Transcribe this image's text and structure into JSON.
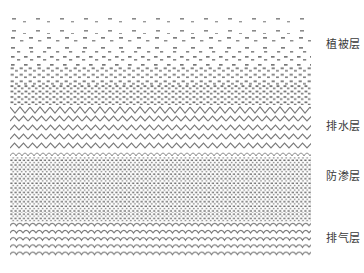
{
  "diagram": {
    "background_color": "#ffffff",
    "hatch_color": "#7a7a7a",
    "label_color": "#3b3b3b",
    "canvas": {
      "width": 364,
      "height": 273
    },
    "drawing_area": {
      "x": 10,
      "y": 14,
      "width": 301,
      "height": 249
    },
    "layers": [
      {
        "id": "vegetation",
        "label": "植被层",
        "pattern": "graduated-dash-stipple",
        "description": "sparse dashes at top becoming progressively denser downward",
        "top": 0,
        "height": 91,
        "label_y": 38
      },
      {
        "id": "drainage",
        "label": "排水层",
        "pattern": "zigzag-wave-rows",
        "description": "five rows of zigzag wave lines",
        "top": 91,
        "height": 45,
        "label_y": 120
      },
      {
        "id": "anti-seepage",
        "label": "防渗层",
        "pattern": "dense-fine-stipple",
        "description": "dense uniform fine dotted stipple fill",
        "top": 136,
        "height": 63,
        "label_y": 170
      },
      {
        "id": "gas-venting",
        "label": "排气层",
        "pattern": "dense-wave-rows",
        "description": "tightly packed rows of small s-waves",
        "top": 199,
        "height": 49,
        "label_y": 232
      }
    ]
  }
}
